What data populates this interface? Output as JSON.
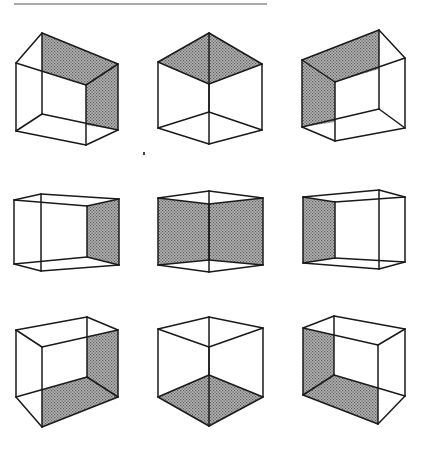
{
  "figure": {
    "title": "",
    "colors": {
      "background": "#ffffff",
      "line": "#1a1a1a",
      "shade_base": "#b4b4b4",
      "shade_dot": "#5a5a5a"
    },
    "rule": {
      "x1": 14,
      "y1": 4,
      "x2": 267,
      "y2": 4
    },
    "speck": {
      "x": 143,
      "y": 152
    },
    "cubes": [
      {
        "id": "cube-1",
        "edges": [
          [
            16,
            63,
            86,
            85
          ],
          [
            86,
            85,
            118,
            64
          ],
          [
            118,
            64,
            42,
            33
          ],
          [
            42,
            33,
            16,
            63
          ],
          [
            16,
            63,
            16,
            131
          ],
          [
            86,
            85,
            86,
            145
          ],
          [
            118,
            64,
            118,
            130
          ],
          [
            42,
            33,
            42,
            114
          ],
          [
            16,
            131,
            86,
            145
          ],
          [
            86,
            145,
            118,
            130
          ],
          [
            118,
            130,
            42,
            114
          ],
          [
            42,
            114,
            16,
            131
          ]
        ],
        "shaded": [
          [
            [
              42,
              33
            ],
            [
              118,
              64
            ],
            [
              86,
              85
            ],
            [
              42,
              71
            ]
          ],
          [
            [
              86,
              85
            ],
            [
              118,
              64
            ],
            [
              118,
              130
            ],
            [
              86,
              125
            ]
          ]
        ]
      },
      {
        "id": "cube-2",
        "edges": [
          [
            158,
            62,
            209,
            33
          ],
          [
            209,
            33,
            262,
            64
          ],
          [
            262,
            64,
            209,
            84
          ],
          [
            209,
            84,
            158,
            62
          ],
          [
            158,
            62,
            158,
            128
          ],
          [
            262,
            64,
            262,
            130
          ],
          [
            209,
            84,
            209,
            144
          ],
          [
            209,
            33,
            209,
            112
          ],
          [
            158,
            128,
            209,
            144
          ],
          [
            209,
            144,
            262,
            130
          ],
          [
            262,
            130,
            209,
            112
          ],
          [
            209,
            112,
            158,
            128
          ]
        ],
        "shaded": [
          [
            [
              158,
              62
            ],
            [
              209,
              33
            ],
            [
              262,
              64
            ],
            [
              209,
              84
            ]
          ]
        ]
      },
      {
        "id": "cube-3",
        "edges": [
          [
            302,
            60,
            379,
            30
          ],
          [
            379,
            30,
            405,
            58
          ],
          [
            405,
            58,
            335,
            82
          ],
          [
            335,
            82,
            302,
            60
          ],
          [
            302,
            60,
            302,
            127
          ],
          [
            405,
            58,
            405,
            128
          ],
          [
            335,
            82,
            335,
            141
          ],
          [
            379,
            30,
            379,
            109
          ],
          [
            302,
            127,
            335,
            141
          ],
          [
            335,
            141,
            405,
            128
          ],
          [
            405,
            128,
            379,
            109
          ],
          [
            379,
            109,
            302,
            127
          ]
        ],
        "shaded": [
          [
            [
              302,
              60
            ],
            [
              379,
              30
            ],
            [
              379,
              69
            ],
            [
              335,
              82
            ]
          ],
          [
            [
              302,
              60
            ],
            [
              335,
              82
            ],
            [
              335,
              122
            ],
            [
              302,
              127
            ]
          ]
        ]
      },
      {
        "id": "cube-4",
        "edges": [
          [
            14,
            200,
            41,
            194
          ],
          [
            41,
            194,
            119,
            199
          ],
          [
            119,
            199,
            87,
            206
          ],
          [
            87,
            206,
            14,
            200
          ],
          [
            14,
            200,
            14,
            264
          ],
          [
            119,
            199,
            119,
            265
          ],
          [
            87,
            206,
            87,
            257
          ],
          [
            41,
            194,
            41,
            271
          ],
          [
            14,
            264,
            41,
            271
          ],
          [
            41,
            271,
            119,
            265
          ],
          [
            119,
            265,
            87,
            257
          ],
          [
            87,
            257,
            14,
            264
          ]
        ],
        "shaded": [
          [
            [
              87,
              206
            ],
            [
              119,
              199
            ],
            [
              119,
              265
            ],
            [
              87,
              257
            ]
          ]
        ]
      },
      {
        "id": "cube-5",
        "edges": [
          [
            158,
            198,
            209,
            191
          ],
          [
            209,
            191,
            263,
            198
          ],
          [
            263,
            198,
            209,
            204
          ],
          [
            209,
            204,
            158,
            198
          ],
          [
            158,
            198,
            158,
            265
          ],
          [
            263,
            198,
            263,
            265
          ],
          [
            209,
            204,
            209,
            260
          ],
          [
            209,
            191,
            209,
            272
          ],
          [
            158,
            265,
            209,
            272
          ],
          [
            209,
            272,
            263,
            265
          ],
          [
            263,
            265,
            209,
            260
          ],
          [
            209,
            260,
            158,
            265
          ]
        ],
        "shaded": [
          [
            [
              158,
              198
            ],
            [
              209,
              204
            ],
            [
              209,
              260
            ],
            [
              158,
              265
            ]
          ],
          [
            [
              209,
              204
            ],
            [
              263,
              198
            ],
            [
              263,
              265
            ],
            [
              209,
              260
            ]
          ]
        ]
      },
      {
        "id": "cube-6",
        "edges": [
          [
            303,
            197,
            379,
            190
          ],
          [
            379,
            190,
            405,
            197
          ],
          [
            405,
            197,
            335,
            202
          ],
          [
            335,
            202,
            303,
            197
          ],
          [
            303,
            197,
            303,
            263
          ],
          [
            405,
            197,
            405,
            262
          ],
          [
            335,
            202,
            335,
            258
          ],
          [
            379,
            190,
            379,
            269
          ],
          [
            303,
            263,
            379,
            269
          ],
          [
            379,
            269,
            405,
            262
          ],
          [
            405,
            262,
            335,
            258
          ],
          [
            335,
            258,
            303,
            263
          ]
        ],
        "shaded": [
          [
            [
              303,
              197
            ],
            [
              335,
              202
            ],
            [
              335,
              258
            ],
            [
              303,
              263
            ]
          ]
        ]
      },
      {
        "id": "cube-7",
        "edges": [
          [
            16,
            330,
            87,
            317
          ],
          [
            87,
            317,
            118,
            330
          ],
          [
            118,
            330,
            42,
            347
          ],
          [
            42,
            347,
            16,
            330
          ],
          [
            16,
            330,
            16,
            397
          ],
          [
            118,
            330,
            118,
            397
          ],
          [
            42,
            347,
            42,
            427
          ],
          [
            87,
            317,
            87,
            377
          ],
          [
            16,
            397,
            87,
            377
          ],
          [
            87,
            377,
            118,
            397
          ],
          [
            118,
            397,
            42,
            427
          ],
          [
            42,
            427,
            16,
            397
          ]
        ],
        "shaded": [
          [
            [
              87,
              337
            ],
            [
              118,
              330
            ],
            [
              118,
              397
            ],
            [
              87,
              377
            ]
          ],
          [
            [
              42,
              390
            ],
            [
              87,
              377
            ],
            [
              118,
              397
            ],
            [
              42,
              427
            ]
          ]
        ]
      },
      {
        "id": "cube-8",
        "edges": [
          [
            158,
            329,
            209,
            317
          ],
          [
            209,
            317,
            263,
            328
          ],
          [
            263,
            328,
            209,
            347
          ],
          [
            209,
            347,
            158,
            329
          ],
          [
            158,
            329,
            158,
            397
          ],
          [
            263,
            328,
            263,
            397
          ],
          [
            209,
            347,
            209,
            426
          ],
          [
            209,
            317,
            209,
            375
          ],
          [
            158,
            397,
            209,
            375
          ],
          [
            209,
            375,
            263,
            397
          ],
          [
            263,
            397,
            209,
            426
          ],
          [
            209,
            426,
            158,
            397
          ]
        ],
        "shaded": [
          [
            [
              158,
              397
            ],
            [
              209,
              375
            ],
            [
              263,
              397
            ],
            [
              209,
              426
            ]
          ]
        ]
      },
      {
        "id": "cube-9",
        "edges": [
          [
            303,
            328,
            334,
            316
          ],
          [
            334,
            316,
            405,
            329
          ],
          [
            405,
            329,
            378,
            345
          ],
          [
            378,
            345,
            303,
            328
          ],
          [
            303,
            328,
            303,
            395
          ],
          [
            405,
            329,
            405,
            396
          ],
          [
            378,
            345,
            378,
            424
          ],
          [
            334,
            316,
            334,
            375
          ],
          [
            303,
            395,
            334,
            375
          ],
          [
            334,
            375,
            405,
            396
          ],
          [
            405,
            396,
            378,
            424
          ],
          [
            378,
            424,
            303,
            395
          ]
        ],
        "shaded": [
          [
            [
              303,
              328
            ],
            [
              334,
              335
            ],
            [
              334,
              375
            ],
            [
              303,
              395
            ]
          ],
          [
            [
              303,
              395
            ],
            [
              334,
              375
            ],
            [
              378,
              388
            ],
            [
              378,
              424
            ]
          ]
        ]
      }
    ]
  }
}
